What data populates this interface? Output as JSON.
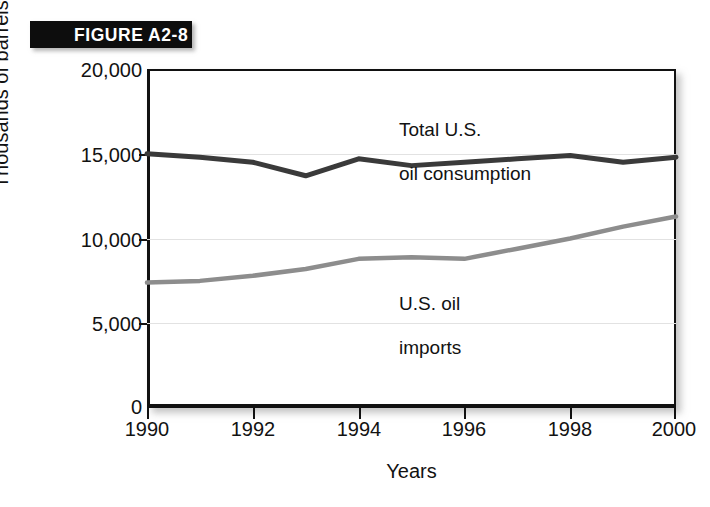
{
  "figure": {
    "banner_label": "FIGURE A2-8"
  },
  "chart_data": {
    "type": "line",
    "title": "",
    "xlabel": "Years",
    "ylabel": "Thousands of barrels a day",
    "x": [
      1990,
      1991,
      1992,
      1993,
      1994,
      1995,
      1996,
      1997,
      1998,
      1999,
      2000
    ],
    "xlim": [
      1990,
      2000
    ],
    "ylim": [
      0,
      20000
    ],
    "xticks": [
      1990,
      1992,
      1994,
      1996,
      1998,
      2000
    ],
    "xtick_labels": [
      "1990",
      "1992",
      "1994",
      "1996",
      "1998",
      "2000"
    ],
    "yticks": [
      0,
      5000,
      10000,
      15000,
      20000
    ],
    "ytick_labels": [
      "0",
      "5,000",
      "10,000",
      "15,000",
      "20,000"
    ],
    "grid": "horizontal",
    "legend": "inline-annotations",
    "series": [
      {
        "name": "Total U.S. oil consumption",
        "label_line1": "Total U.S.",
        "label_line2": "oil consumption",
        "color": "#3a3a3a",
        "values": [
          15000,
          14800,
          14500,
          13700,
          14700,
          14300,
          14500,
          14700,
          14900,
          14500,
          14800
        ]
      },
      {
        "name": "U.S. oil imports",
        "label_line1": "U.S. oil",
        "label_line2": "imports",
        "color": "#8d8d8d",
        "values": [
          7400,
          7500,
          7800,
          8200,
          8800,
          8900,
          8800,
          9400,
          10000,
          10700,
          11300
        ]
      }
    ]
  }
}
